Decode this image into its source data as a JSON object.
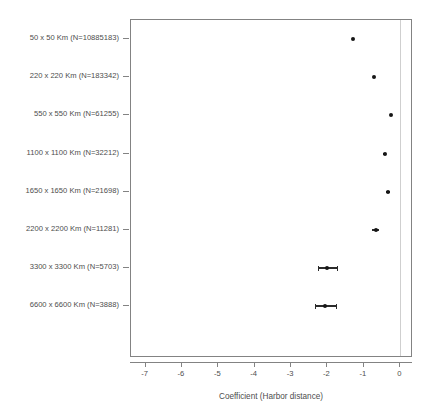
{
  "chart_data": {
    "type": "scatter",
    "title": "",
    "subtitle": "",
    "xlabel": "Coefficient (Harbor distance)",
    "ylabel": "",
    "xlim": [
      -7.4,
      0.35
    ],
    "ylim": [
      0,
      9
    ],
    "grid": false,
    "legend": null,
    "reference_line": {
      "x": 0,
      "color": "#cfcfcf"
    },
    "xticks": [
      -7,
      -6,
      -5,
      -4,
      -3,
      -2,
      -1,
      0
    ],
    "xticklabels": [
      "-7",
      "-6",
      "-5",
      "-4",
      "-3",
      "-2",
      "-1",
      "0"
    ],
    "categories": [
      "50 x 50 Km (N=10885183)",
      "220 x 220 Km (N=183342)",
      "550 x 550 Km (N=61255)",
      "1100 x 1100 Km (N=32212)",
      "1650 x 1650 Km (N=21698)",
      "2200 x 2200 Km (N=11281)",
      "3300 x 3300 Km (N=5703)",
      "6600 x 6600 Km (N=3888)"
    ],
    "values": [
      -1.31,
      -0.73,
      -0.26,
      -0.43,
      -0.33,
      -0.68,
      -2.01,
      -2.06
    ],
    "ci_low": [
      -1.33,
      -0.76,
      -0.29,
      -0.48,
      -0.38,
      -0.77,
      -2.27,
      -2.35
    ],
    "ci_high": [
      -1.29,
      -0.7,
      -0.23,
      -0.38,
      -0.28,
      -0.59,
      -1.75,
      -1.77
    ],
    "points": [
      {
        "label": "50 x 50 Km (N=10885183)",
        "n": 10885183,
        "coefficient": -1.31,
        "ci_low": -1.33,
        "ci_high": -1.29
      },
      {
        "label": "220 x 220 Km (N=183342)",
        "n": 183342,
        "coefficient": -0.73,
        "ci_low": -0.76,
        "ci_high": -0.7
      },
      {
        "label": "550 x 550 Km (N=61255)",
        "n": 61255,
        "coefficient": -0.26,
        "ci_low": -0.29,
        "ci_high": -0.23
      },
      {
        "label": "1100 x 1100 Km (N=32212)",
        "n": 32212,
        "coefficient": -0.43,
        "ci_low": -0.48,
        "ci_high": -0.38
      },
      {
        "label": "1650 x 1650 Km (N=21698)",
        "n": 21698,
        "coefficient": -0.33,
        "ci_low": -0.38,
        "ci_high": -0.28
      },
      {
        "label": "2200 x 2200 Km (N=11281)",
        "n": 11281,
        "coefficient": -0.68,
        "ci_low": -0.77,
        "ci_high": -0.59
      },
      {
        "label": "3300 x 3300 Km (N=5703)",
        "n": 5703,
        "coefficient": -2.01,
        "ci_low": -2.27,
        "ci_high": -1.75
      },
      {
        "label": "6600 x 6600 Km (N=3888)",
        "n": 3888,
        "coefficient": -2.06,
        "ci_low": -2.35,
        "ci_high": -1.77
      }
    ]
  },
  "colors": {
    "point": "#161616",
    "ci": "#2b2b2b",
    "axis": "#838383",
    "text": "#4d4d4d",
    "reference": "#cfcfcf",
    "background": "#ffffff"
  }
}
